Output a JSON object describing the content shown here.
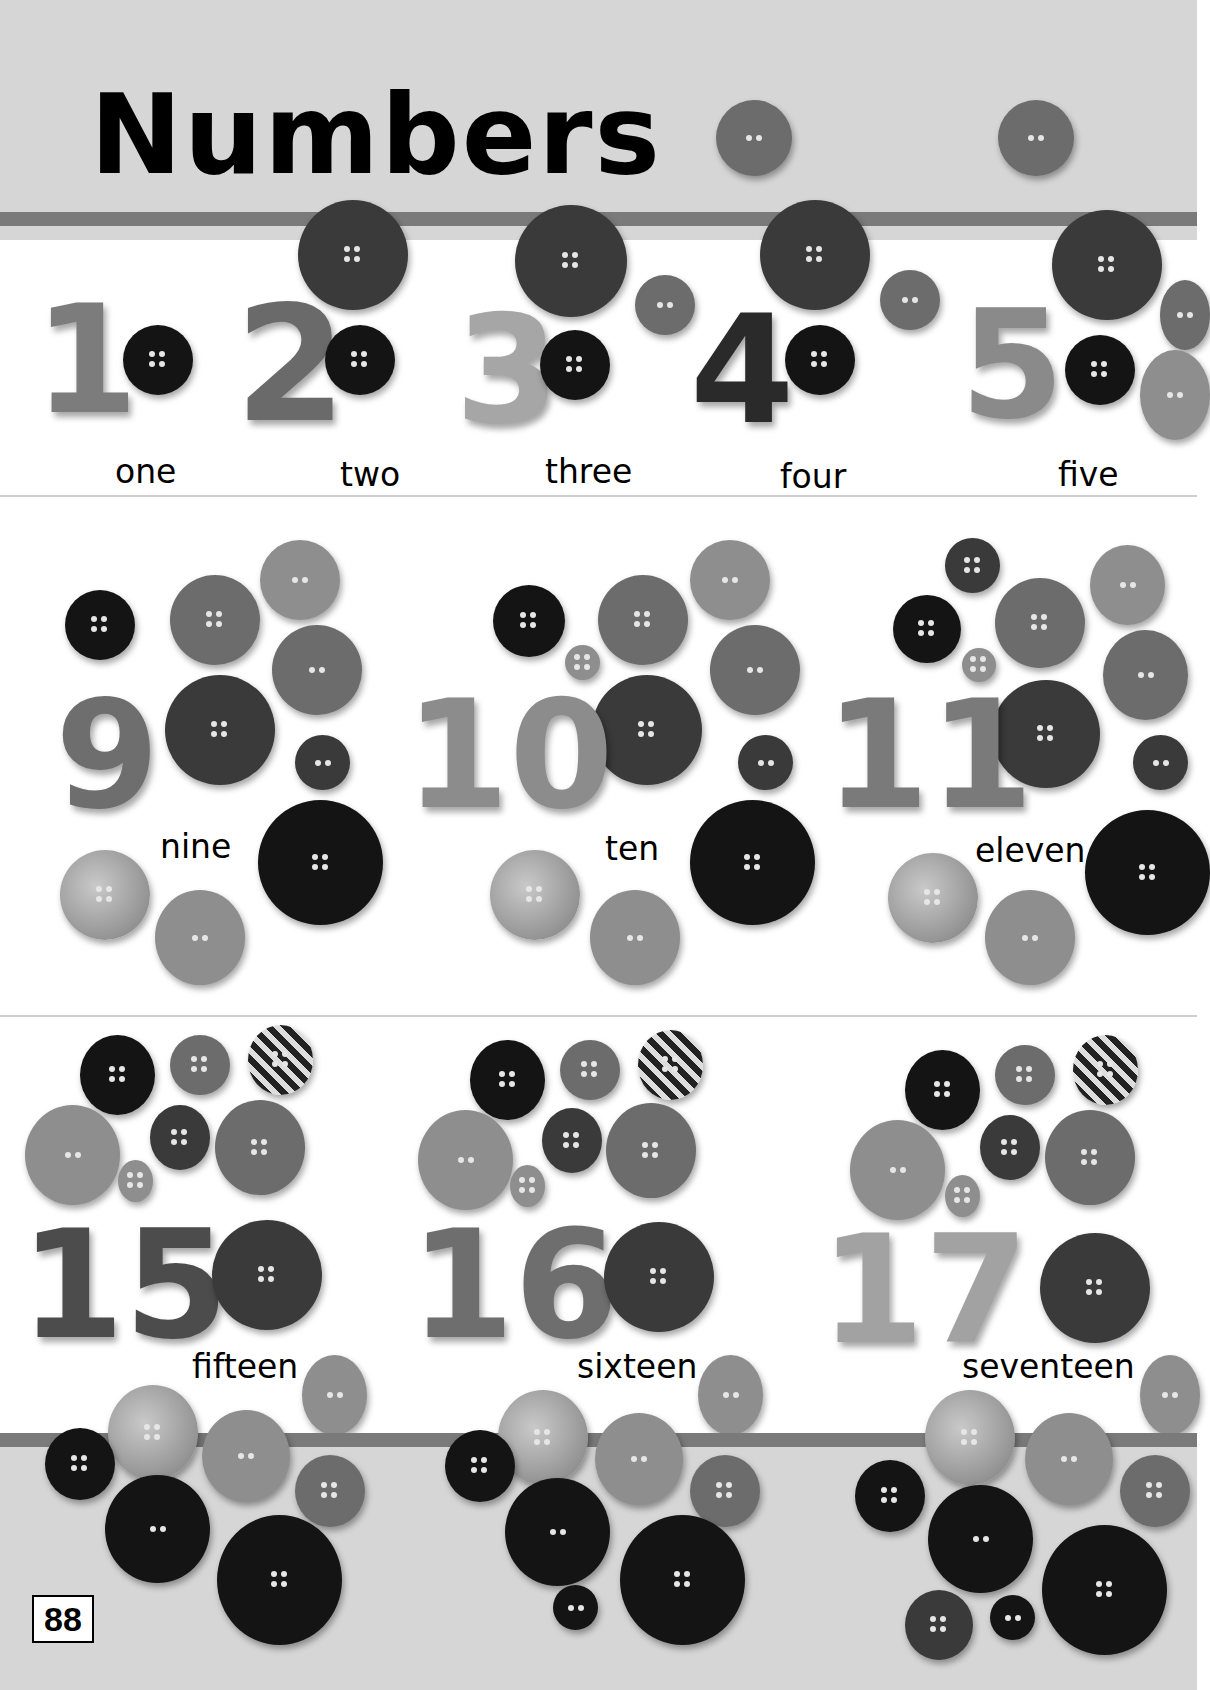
{
  "page": {
    "title": "Numbers",
    "page_number": "88"
  },
  "rows": [
    {
      "items": [
        {
          "numeral": "1",
          "word": "one"
        },
        {
          "numeral": "2",
          "word": "two"
        },
        {
          "numeral": "3",
          "word": "three"
        },
        {
          "numeral": "4",
          "word": "four"
        },
        {
          "numeral": "5",
          "word": "five"
        }
      ]
    },
    {
      "items": [
        {
          "numeral": "9",
          "word": "nine"
        },
        {
          "numeral": "10",
          "word": "ten"
        },
        {
          "numeral": "11",
          "word": "eleven"
        }
      ]
    },
    {
      "items": [
        {
          "numeral": "15",
          "word": "fifteen"
        },
        {
          "numeral": "16",
          "word": "sixteen"
        },
        {
          "numeral": "17",
          "word": "seventeen"
        }
      ]
    }
  ],
  "colors": {
    "band": "#d6d6d6",
    "stripe": "#7a7a7a",
    "text": "#000000"
  }
}
